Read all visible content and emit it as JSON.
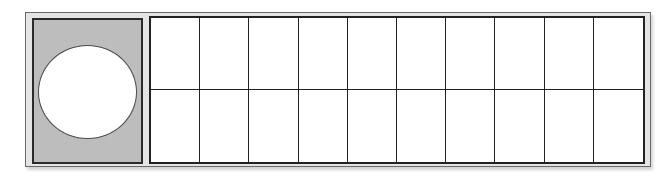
{
  "diagram": {
    "type": "panel-with-grid",
    "left_panel": {
      "shape": "circle",
      "fill": "#bdbdbd",
      "circle_fill": "#ffffff"
    },
    "grid": {
      "rows": 2,
      "columns": 10,
      "cell_fill": "#ffffff",
      "line_color": "#222222"
    },
    "frame_fill": "#e4e4e4"
  }
}
